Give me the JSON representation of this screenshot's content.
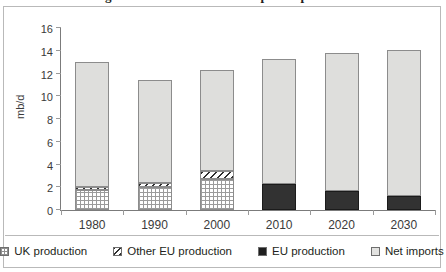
{
  "figure": {
    "clipped_title": "Figure: EU oil balance and import dependence"
  },
  "legend": {
    "items": [
      {
        "label": "UK production",
        "key": "uk_production",
        "swatch": "uk-production"
      },
      {
        "label": "Other EU production",
        "key": "other_eu_production",
        "swatch": "other-eu-production"
      },
      {
        "label": "EU production",
        "key": "eu_production",
        "swatch": "eu-production"
      },
      {
        "label": "Net imports",
        "key": "net_imports",
        "swatch": "net-imports"
      }
    ]
  },
  "chart_data": {
    "type": "bar",
    "stacked": true,
    "title": "",
    "xlabel": "",
    "ylabel": "mb/d",
    "ylim": [
      0,
      16
    ],
    "ytick_step": 2,
    "ytick_labels": [
      "0",
      "2",
      "4",
      "6",
      "8",
      "10",
      "12",
      "14",
      "16"
    ],
    "grid": false,
    "legend_position": "bottom",
    "categories": [
      "1980",
      "1990",
      "2000",
      "2010",
      "2020",
      "2030"
    ],
    "series": [
      {
        "name": "UK production",
        "values": [
          1.75,
          2.0,
          2.75,
          0,
          0,
          0
        ]
      },
      {
        "name": "Other EU production",
        "values": [
          0.25,
          0.4,
          0.65,
          0,
          0,
          0
        ]
      },
      {
        "name": "EU production",
        "values": [
          0,
          0,
          0,
          2.3,
          1.7,
          1.25
        ]
      },
      {
        "name": "Net imports",
        "values": [
          11.0,
          9.0,
          8.9,
          11.0,
          12.1,
          12.8
        ]
      }
    ],
    "totals": [
      13.0,
      11.4,
      12.3,
      13.3,
      13.8,
      14.05
    ],
    "colors": {
      "net_imports": "#dededc",
      "eu_production": "#323232",
      "uk_production": "#ffffff",
      "other_eu_production": "#ffffff",
      "axis": "#7b7b7b",
      "frame": "#b9b9b9"
    }
  }
}
